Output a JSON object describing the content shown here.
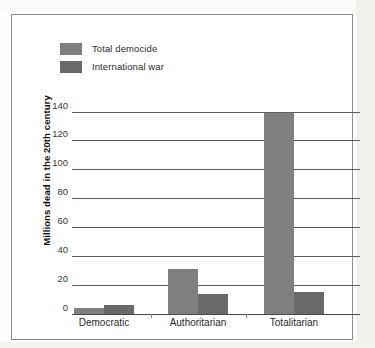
{
  "figure": {
    "frame_color": "#8d8d8d",
    "background": "#ffffff"
  },
  "legend": {
    "position": "top-left",
    "items": [
      {
        "label": "Total democide",
        "color": "#7f7f7f",
        "swatch_name": "legend-swatch-total-democide"
      },
      {
        "label": "International war",
        "color": "#6a6a6a",
        "swatch_name": "legend-swatch-international-war"
      }
    ]
  },
  "axes": {
    "y_title": "Millions dead in the 20th century",
    "y_ticks": [
      "140",
      "120",
      "100",
      "80",
      "60",
      "40",
      "20",
      "0"
    ],
    "x_ticks": [
      "Democratic",
      "Authoritarian",
      "Totalitarian"
    ]
  },
  "chart_data": {
    "type": "bar",
    "title": "",
    "xlabel": "",
    "ylabel": "Millions dead in the 20th century",
    "categories": [
      "Democratic",
      "Authoritarian",
      "Totalitarian"
    ],
    "series": [
      {
        "name": "Total democide",
        "color": "#7f7f7f",
        "values": [
          4,
          31,
          139
        ]
      },
      {
        "name": "International war",
        "color": "#6a6a6a",
        "values": [
          6,
          14,
          15
        ]
      }
    ],
    "ylim": [
      0,
      148
    ],
    "ytick_values": [
      0,
      20,
      40,
      60,
      80,
      100,
      120,
      140
    ],
    "grid": true,
    "legend_position": "top-left"
  }
}
